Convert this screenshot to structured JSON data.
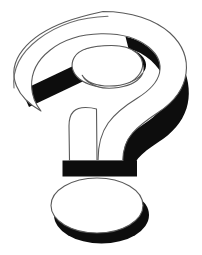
{
  "canvas": {
    "width": 202,
    "height": 255,
    "background_color": "#ffffff",
    "alt_text": "Question mark"
  },
  "graphic": {
    "name": "question-mark",
    "symbol": "?",
    "style": "3d-extruded-outline",
    "description": "A large three-dimensional question mark rendered as a white outlined face with heavy solid black extruded shadow on the right and lower sides, above a separate oval dot with matching black shadow.",
    "colors": {
      "face": "#ffffff",
      "shadow": "#0d0d0d",
      "outline": "#5a5a5a"
    },
    "parts": [
      {
        "name": "hook-ring",
        "label": "Upper curved hook of the question mark",
        "face_color": "#ffffff",
        "shadow_color": "#0d0d0d"
      },
      {
        "name": "hook-inner-hole",
        "label": "Inner elliptical opening of the hook",
        "face_color": "#ffffff",
        "shadow_color": "#0d0d0d"
      },
      {
        "name": "tail-bar",
        "label": "Diagonal black terminal bar at lower left of the hook",
        "face_color": "#0d0d0d",
        "shadow_color": "#0d0d0d"
      },
      {
        "name": "stem",
        "label": "Vertical stem descending from the hook",
        "face_color": "#ffffff",
        "shadow_color": "#0d0d0d"
      },
      {
        "name": "stem-base-bar",
        "label": "Horizontal black base bar under the stem",
        "face_color": "#0d0d0d",
        "shadow_color": "#0d0d0d"
      },
      {
        "name": "dot",
        "label": "Oval dot beneath the stem",
        "face_color": "#ffffff",
        "shadow_color": "#0d0d0d"
      }
    ]
  }
}
